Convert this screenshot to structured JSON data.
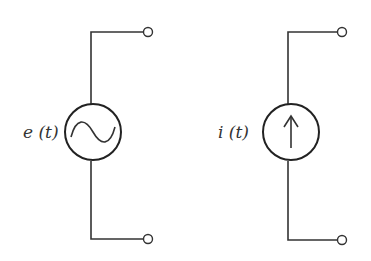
{
  "diagram": {
    "title": "",
    "components": [
      {
        "id": "voltage-source",
        "type": "ac-voltage-source",
        "label": "e (t)",
        "symbol": "sine-wave"
      },
      {
        "id": "current-source",
        "type": "current-source",
        "label": "i (t)",
        "symbol": "up-arrow"
      }
    ],
    "colors": {
      "line": "#333333",
      "background": "#ffffff"
    }
  }
}
